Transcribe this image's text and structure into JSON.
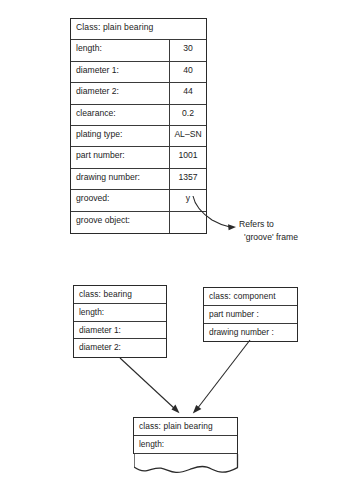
{
  "instance_frame": {
    "title": "Class:  plain bearing",
    "rows": [
      {
        "slot": "length:",
        "value": "30"
      },
      {
        "slot": "diameter 1:",
        "value": "40"
      },
      {
        "slot": "diameter 2:",
        "value": "44"
      },
      {
        "slot": "clearance:",
        "value": "0.2"
      },
      {
        "slot": "plating type:",
        "value": "AL–SN"
      },
      {
        "slot": "part number:",
        "value": "1001"
      },
      {
        "slot": "drawing number:",
        "value": "1357"
      },
      {
        "slot": "grooved:",
        "value": "y"
      },
      {
        "slot": "groove object:",
        "value": ""
      }
    ]
  },
  "annotation": {
    "line1": "Refers to",
    "line2": "'groove' frame"
  },
  "class_bearing": {
    "title": "class: bearing",
    "slots": [
      "length:",
      "diameter 1:",
      "diameter 2:"
    ]
  },
  "class_component": {
    "title": "class: component",
    "slots": [
      "part number :",
      "drawing number :"
    ]
  },
  "class_plain_bearing": {
    "title": "class: plain bearing",
    "slots": [
      "length:"
    ]
  },
  "colors": {
    "line": "#2a2a2a",
    "inner_rule": "#3a3a3a",
    "text": "#1c1c1c",
    "background": "#ffffff"
  }
}
